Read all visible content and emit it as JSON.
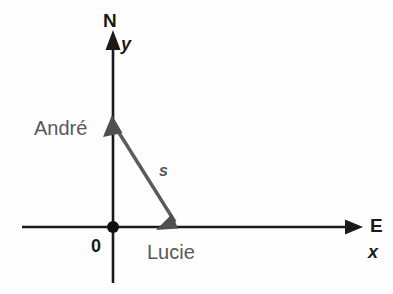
{
  "diagram": {
    "background_color": "#fefefe",
    "axis_color": "#1a1a1a",
    "vector_color": "#5a5a5a",
    "label_gray": "#585858",
    "labels": {
      "north": "N",
      "east": "E",
      "y_axis": "y",
      "x_axis": "x",
      "origin": "0",
      "andre": "André",
      "lucie": "Lucie",
      "vector": "s"
    },
    "geometry": {
      "origin": [
        113,
        227
      ],
      "y_axis_from": [
        113,
        283
      ],
      "y_axis_to": [
        113,
        32
      ],
      "x_axis_from": [
        22,
        227
      ],
      "x_axis_to": [
        362,
        227
      ],
      "andre_point": [
        113,
        120
      ],
      "lucie_point": [
        178,
        227
      ],
      "vector_from": "andre_point",
      "vector_to": "lucie_point",
      "vector_double_headed": true
    }
  }
}
